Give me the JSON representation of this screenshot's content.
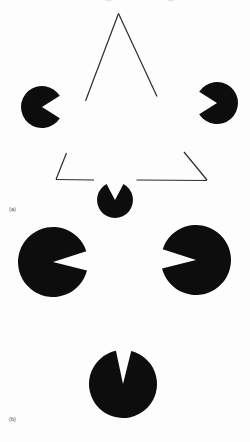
{
  "figure": {
    "width": 250,
    "height": 442,
    "background_color": "#fdfdfd",
    "ink_color": "#0d0d0d",
    "line_color": "#2b2b2b"
  },
  "panels": [
    {
      "id": "a",
      "label": "(a)",
      "label_position": {
        "x": 9,
        "y": 207
      },
      "description": "Three black pac-man discs with notches aimed inward plus an outlined triangle, producing an illusory bright triangle"
    },
    {
      "id": "b",
      "label": "(b)",
      "label_position": {
        "x": 9,
        "y": 417
      },
      "description": "Three larger black pac-man discs with narrow wedge notches and no outline triangle"
    }
  ],
  "chart_data": {
    "type": "scatter",
    "xlabel": "",
    "ylabel": "",
    "panels": [
      "(a)",
      "(b)"
    ],
    "shapes": [
      {
        "panel": "a",
        "name": "pacman-left",
        "kind": "pacman",
        "cx": 42,
        "cy": 107,
        "r": 21,
        "notch_start_deg": -32,
        "notch_end_deg": 32,
        "fill": "#0d0d0d"
      },
      {
        "panel": "a",
        "name": "pacman-right",
        "kind": "pacman",
        "cx": 217,
        "cy": 103,
        "r": 21,
        "notch_start_deg": 148,
        "notch_end_deg": 212,
        "fill": "#0d0d0d"
      },
      {
        "panel": "a",
        "name": "pacman-bottom",
        "kind": "pacman",
        "cx": 115,
        "cy": 200,
        "r": 18,
        "notch_start_deg": 242,
        "notch_end_deg": 298,
        "fill": "#0d0d0d"
      },
      {
        "panel": "a",
        "name": "outline-triangle",
        "kind": "triangle-outline",
        "vertices": [
          [
            118,
            13
          ],
          [
            56,
            179
          ],
          [
            207,
            180
          ]
        ],
        "stroke": "#2b2b2b",
        "stroke_width": 1.1,
        "gaps": "edges interrupted near each pac-man notch"
      },
      {
        "panel": "b",
        "name": "pacman-left",
        "kind": "pacman",
        "cx": 53,
        "cy": 262,
        "r": 35,
        "notch_start_deg": -18,
        "notch_end_deg": 14,
        "fill": "#0d0d0d"
      },
      {
        "panel": "b",
        "name": "pacman-right",
        "kind": "pacman",
        "cx": 196,
        "cy": 260,
        "r": 35,
        "notch_start_deg": 166,
        "notch_end_deg": 198,
        "fill": "#0d0d0d"
      },
      {
        "panel": "b",
        "name": "pacman-bottom",
        "kind": "pacman",
        "cx": 123,
        "cy": 384,
        "r": 34,
        "notch_start_deg": 258,
        "notch_end_deg": 284,
        "fill": "#0d0d0d"
      }
    ]
  }
}
